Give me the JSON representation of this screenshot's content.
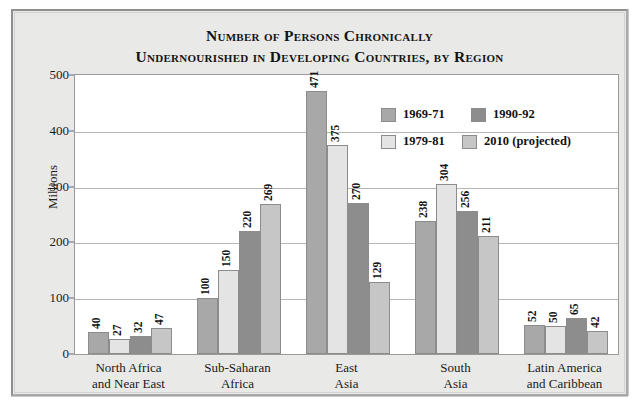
{
  "title": {
    "line1": "Number of Persons Chronically",
    "line2": "Undernourished in Developing Countries, by Region"
  },
  "axes": {
    "y_title": "Millions",
    "y_ticks": [
      "0",
      "100",
      "200",
      "300",
      "400",
      "500"
    ]
  },
  "legend": {
    "items": [
      {
        "label": "1969-71",
        "color": "#a8a8a8"
      },
      {
        "label": "1990-92",
        "color": "#8d8d8d"
      },
      {
        "label": "1979-81",
        "color": "#e4e4e4"
      },
      {
        "label": "2010 (projected)",
        "color": "#c6c6c6"
      }
    ]
  },
  "chart_data": {
    "type": "bar",
    "title": "Number of Persons Chronically Undernourished in Developing Countries, by Region",
    "xlabel": "",
    "ylabel": "Millions",
    "ylim": [
      0,
      500
    ],
    "ytick_step": 100,
    "grid": true,
    "legend_position": "inside-upper-right",
    "categories": [
      "North Africa and Near East",
      "Sub-Saharan Africa",
      "East Asia",
      "South Asia",
      "Latin America and Caribbean"
    ],
    "category_lines": [
      [
        "North Africa",
        "and Near East"
      ],
      [
        "Sub-Saharan",
        "Africa"
      ],
      [
        "East",
        "Asia"
      ],
      [
        "South",
        "Asia"
      ],
      [
        "Latin America",
        "and Caribbean"
      ]
    ],
    "series": [
      {
        "name": "1969-71",
        "color": "#a8a8a8",
        "values": [
          40,
          100,
          471,
          238,
          52
        ]
      },
      {
        "name": "1979-81",
        "color": "#e4e4e4",
        "values": [
          27,
          150,
          375,
          304,
          50
        ]
      },
      {
        "name": "1990-92",
        "color": "#8d8d8d",
        "values": [
          32,
          220,
          270,
          256,
          65
        ]
      },
      {
        "name": "2010 (projected)",
        "color": "#c6c6c6",
        "values": [
          47,
          269,
          129,
          211,
          42
        ]
      }
    ]
  }
}
